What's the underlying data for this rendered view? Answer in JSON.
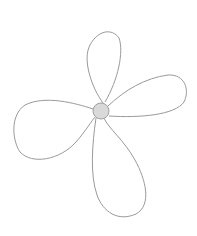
{
  "drawing": {
    "subject": "four-petal flower line drawing",
    "colors": {
      "background": "#ffffff",
      "stroke": "#9a9a9a",
      "center_fill": "#d9d9d9",
      "center_stroke": "#a0a0a0"
    },
    "center": {
      "cx": 101,
      "cy": 111,
      "r": 8
    },
    "petals": [
      {
        "name": "top",
        "path": "M103,103 C92,88 82,60 90,45 C98,30 112,28 119,38 C124,52 118,80 105,102"
      },
      {
        "name": "right",
        "path": "M108,106 C125,90 145,78 168,75 C185,74 190,90 184,102 C175,115 140,118 109,116"
      },
      {
        "name": "left",
        "path": "M93,109 C75,103 45,95 25,105 C10,115 12,140 20,152 C32,165 60,160 76,142 C85,132 92,120 96,116"
      },
      {
        "name": "bottom",
        "path": "M96,118 C92,145 90,175 97,195 C103,212 118,222 136,214 C152,205 146,180 135,160 C124,140 108,128 104,118"
      }
    ]
  }
}
